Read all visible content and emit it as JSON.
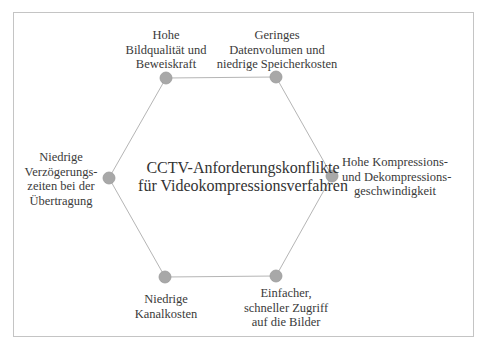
{
  "diagram": {
    "center_title": {
      "line1": "CCTV-Anforderungskonflikte",
      "line2": "für Videokompressionsverfahren"
    },
    "nodes": [
      {
        "id": "top-left",
        "lines": [
          "Hohe",
          "Bildqualität und",
          "Beweiskraft"
        ],
        "x": 166,
        "y": 78
      },
      {
        "id": "top-right",
        "lines": [
          "Geringes",
          "Datenvolumen und",
          "niedrige Speicherkosten"
        ],
        "x": 276,
        "y": 77
      },
      {
        "id": "right",
        "lines": [
          "Hohe Kompressions-",
          "und Dekompressions-",
          "geschwindigkeit"
        ],
        "x": 332,
        "y": 176
      },
      {
        "id": "bottom-right",
        "lines": [
          "Einfacher,",
          "schneller Zugriff",
          "auf die Bilder"
        ],
        "x": 276,
        "y": 276
      },
      {
        "id": "bottom-left",
        "lines": [
          "Niedrige",
          "Kanalkosten"
        ],
        "x": 165,
        "y": 277
      },
      {
        "id": "left",
        "lines": [
          "Niedrige",
          "Verzögerungs-",
          "zeiten bei der",
          "Übertragung"
        ],
        "x": 109,
        "y": 178
      }
    ],
    "colors": {
      "node_fill": "#a8a8a8",
      "node_stroke": "#999999",
      "edge": "#b5b5b5",
      "frame": "#c4c4c4",
      "text": "#333333"
    }
  }
}
